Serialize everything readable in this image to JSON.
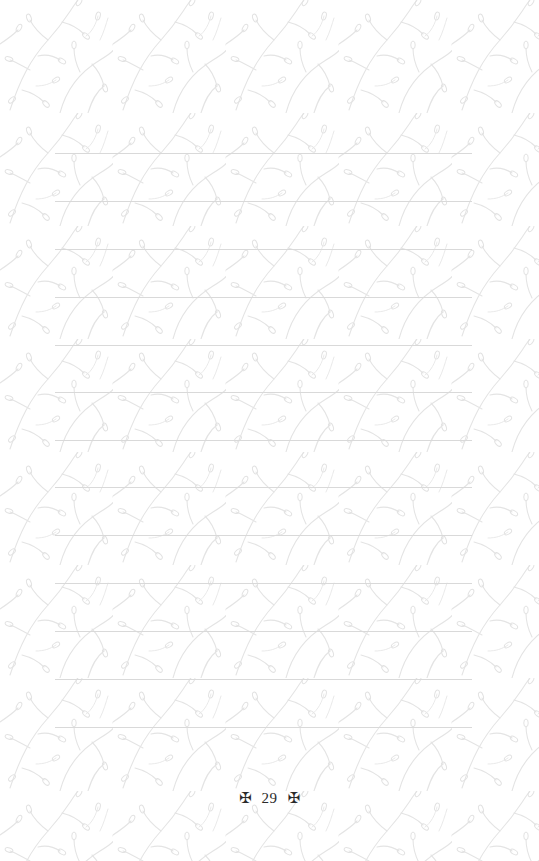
{
  "page": {
    "background_color": "#ffffff",
    "pattern": {
      "motif": "botanical-vine-leaves",
      "color": "#e6e6e6",
      "tile_width": 113,
      "tile_height": 113
    },
    "ruled_lines": {
      "count": 13,
      "first_y": 153,
      "spacing": 48,
      "left": 55,
      "right": 472,
      "color": "#d9d9d9"
    },
    "footer": {
      "left_ornament": "✠",
      "page_number": "29",
      "right_ornament": "✠"
    }
  }
}
